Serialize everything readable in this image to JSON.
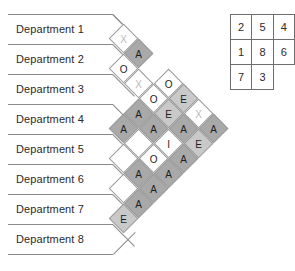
{
  "chart_data": {
    "type": "table",
    "departments": [
      "Department 1",
      "Department 2",
      "Department 3",
      "Department 4",
      "Department 5",
      "Department 6",
      "Department 7",
      "Department 8"
    ],
    "rating_scale": [
      "A",
      "E",
      "I",
      "O",
      "U",
      "X"
    ],
    "relationships": [
      {
        "from": 1,
        "to": 2,
        "rating": "X"
      },
      {
        "from": 1,
        "to": 3,
        "rating": "O"
      },
      {
        "from": 1,
        "to": 4,
        "rating": "X"
      },
      {
        "from": 1,
        "to": 5,
        "rating": "A"
      },
      {
        "from": 1,
        "to": 6,
        "rating": "U"
      },
      {
        "from": 1,
        "to": 7,
        "rating": "U"
      },
      {
        "from": 1,
        "to": 8,
        "rating": "E"
      },
      {
        "from": 2,
        "to": 3,
        "rating": "A"
      },
      {
        "from": 2,
        "to": 4,
        "rating": "O"
      },
      {
        "from": 2,
        "to": 5,
        "rating": "A"
      },
      {
        "from": 2,
        "to": 6,
        "rating": "U"
      },
      {
        "from": 2,
        "to": 7,
        "rating": "A"
      },
      {
        "from": 2,
        "to": 8,
        "rating": "A"
      },
      {
        "from": 3,
        "to": 4,
        "rating": "O"
      },
      {
        "from": 3,
        "to": 5,
        "rating": "A"
      },
      {
        "from": 3,
        "to": 6,
        "rating": "O"
      },
      {
        "from": 3,
        "to": 7,
        "rating": "A"
      },
      {
        "from": 3,
        "to": 8,
        "rating": "A"
      },
      {
        "from": 4,
        "to": 5,
        "rating": "E"
      },
      {
        "from": 4,
        "to": 6,
        "rating": "I"
      },
      {
        "from": 4,
        "to": 7,
        "rating": "A"
      },
      {
        "from": 4,
        "to": 8,
        "rating": "A"
      },
      {
        "from": 5,
        "to": 6,
        "rating": "E"
      },
      {
        "from": 5,
        "to": 7,
        "rating": "A"
      },
      {
        "from": 5,
        "to": 8,
        "rating": "E"
      },
      {
        "from": 6,
        "to": 7,
        "rating": "X"
      },
      {
        "from": 6,
        "to": 8,
        "rating": "A"
      },
      {
        "from": 7,
        "to": 8,
        "rating": "A"
      }
    ],
    "cells": [
      {
        "row": 0,
        "col": 0,
        "rating": "X"
      },
      {
        "row": 1,
        "col": 0,
        "rating": "A"
      },
      {
        "row": 1,
        "col": 1,
        "rating": "O"
      },
      {
        "row": 2,
        "col": 0,
        "rating": "X"
      },
      {
        "row": 2,
        "col": 1,
        "rating": "O"
      },
      {
        "row": 3,
        "col": 0,
        "rating": "O"
      },
      {
        "row": 3,
        "col": 1,
        "rating": "E"
      },
      {
        "row": 4,
        "col": 0,
        "rating": "A"
      },
      {
        "row": 4,
        "col": 1,
        "rating": "E"
      },
      {
        "row": 4,
        "col": 2,
        "rating": "X"
      },
      {
        "row": 5,
        "col": 0,
        "rating": "A"
      },
      {
        "row": 5,
        "col": 1,
        "rating": "A"
      },
      {
        "row": 5,
        "col": 2,
        "rating": "A"
      },
      {
        "row": 5,
        "col": 3,
        "rating": "A"
      },
      {
        "row": 6,
        "col": 0,
        "rating": "U"
      },
      {
        "row": 6,
        "col": 1,
        "rating": "I"
      },
      {
        "row": 6,
        "col": 2,
        "rating": "E"
      },
      {
        "row": 7,
        "col": 0,
        "rating": "O"
      },
      {
        "row": 7,
        "col": 1,
        "rating": "A"
      },
      {
        "row": 8,
        "col": 0,
        "rating": "A"
      },
      {
        "row": 8,
        "col": 1,
        "rating": "A"
      },
      {
        "row": 9,
        "col": 0,
        "rating": "A"
      },
      {
        "row": 10,
        "col": 0,
        "rating": "A"
      },
      {
        "row": 11,
        "col": 0,
        "rating": "E"
      }
    ]
  },
  "rel_chart": {
    "diamonds": [
      {
        "x": 124,
        "y": 39,
        "rating": "X"
      },
      {
        "x": 139,
        "y": 54,
        "rating": "A"
      },
      {
        "x": 124,
        "y": 69,
        "rating": "O"
      },
      {
        "x": 139,
        "y": 84,
        "rating": "X"
      },
      {
        "x": 169,
        "y": 84,
        "rating": "O"
      },
      {
        "x": 154,
        "y": 99,
        "rating": "O"
      },
      {
        "x": 184,
        "y": 99,
        "rating": "E"
      },
      {
        "x": 139,
        "y": 114,
        "rating": "A"
      },
      {
        "x": 169,
        "y": 114,
        "rating": "E"
      },
      {
        "x": 199,
        "y": 114,
        "rating": "X"
      },
      {
        "x": 124,
        "y": 129,
        "rating": "A"
      },
      {
        "x": 154,
        "y": 129,
        "rating": "A"
      },
      {
        "x": 184,
        "y": 129,
        "rating": "A"
      },
      {
        "x": 214,
        "y": 129,
        "rating": "A"
      },
      {
        "x": 139,
        "y": 144,
        "rating": "U"
      },
      {
        "x": 169,
        "y": 144,
        "rating": "I"
      },
      {
        "x": 199,
        "y": 144,
        "rating": "E"
      },
      {
        "x": 124,
        "y": 159,
        "rating": "U"
      },
      {
        "x": 154,
        "y": 159,
        "rating": "O"
      },
      {
        "x": 184,
        "y": 159,
        "rating": "A"
      },
      {
        "x": 139,
        "y": 174,
        "rating": "A"
      },
      {
        "x": 169,
        "y": 174,
        "rating": "A"
      },
      {
        "x": 124,
        "y": 189,
        "rating": "U"
      },
      {
        "x": 154,
        "y": 189,
        "rating": "A"
      },
      {
        "x": 139,
        "y": 204,
        "rating": "A"
      },
      {
        "x": 124,
        "y": 219,
        "rating": "E"
      }
    ]
  },
  "department_bars": {
    "rows": [
      {
        "label": "Department 1",
        "y": 14,
        "rule_y": 14,
        "rule_w": 105,
        "diag_x": 105,
        "diag_w": 22
      },
      {
        "label": "Department 2",
        "y": 44,
        "rule_y": 44,
        "rule_w": 105,
        "diag_x": 105,
        "diag_w": 22
      },
      {
        "label": "Department 3",
        "y": 74,
        "rule_y": 74,
        "rule_w": 105,
        "diag_x": 105,
        "diag_w": 22
      },
      {
        "label": "Department 4",
        "y": 104,
        "rule_y": 104,
        "rule_w": 105,
        "diag_x": 105,
        "diag_w": 22
      },
      {
        "label": "Department 5",
        "y": 134,
        "rule_y": 134,
        "rule_w": 105,
        "diag_x": 105,
        "diag_w": 22
      },
      {
        "label": "Department 6",
        "y": 164,
        "rule_y": 164,
        "rule_w": 105,
        "diag_x": 105,
        "diag_w": 22
      },
      {
        "label": "Department 7",
        "y": 194,
        "rule_y": 194,
        "rule_w": 105,
        "diag_x": 105,
        "diag_w": 22
      },
      {
        "label": "Department 8",
        "y": 224,
        "rule_y": 224,
        "rule_w": 105,
        "diag_x": 105,
        "diag_w": 22
      }
    ],
    "bottom_rule_y": 254
  },
  "layout_table": {
    "x": 230,
    "y": 14,
    "rows": [
      [
        "2",
        "5",
        "4"
      ],
      [
        "1",
        "8",
        "6"
      ],
      [
        "7",
        "3",
        ""
      ]
    ]
  },
  "colors": {
    "rating_A": "#a9a9a9",
    "rating_E": "#c9c9c9",
    "rating_I": "#ffffff",
    "rating_O": "#ffffff",
    "rating_U": "#ffffff",
    "rating_X": "#ffffff",
    "x_glyph": "#b9b9b9",
    "line": "#8a8a8a",
    "cell_border": "#9a9a9a",
    "table_border": "#6e6e6e",
    "text": "#2b2b2b",
    "background": "#ffffff"
  }
}
